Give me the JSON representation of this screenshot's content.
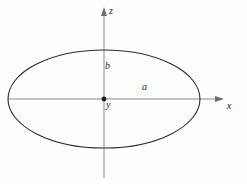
{
  "figure": {
    "kind": "ellipse-coordinate-diagram",
    "background_color": "#fefefe",
    "stroke_color": "#2b2b2b",
    "axis_color": "#8a8a8a",
    "label_color": "#1b1b1b"
  },
  "axes": {
    "vertical": {
      "name": "z-axis",
      "label": "z",
      "arrow_direction": "up",
      "x": 104,
      "y_top": 8,
      "y_bottom": 178
    },
    "horizontal": {
      "name": "x-axis",
      "label": "x",
      "arrow_direction": "right",
      "y": 99,
      "x_left": 8,
      "x_right": 224
    },
    "into_page": {
      "name": "y-axis",
      "label": "y",
      "marker": "origin-dot"
    }
  },
  "origin": {
    "label": "y",
    "cx": 104,
    "cy": 99,
    "dot_radius": 2.4
  },
  "ellipse": {
    "cx": 104,
    "cy": 99,
    "semi_major_a": 96,
    "semi_minor_b": 49,
    "stroke_width": 1.1
  },
  "parameters": [
    {
      "name": "semi-minor-axis",
      "label": "b",
      "axis": "z",
      "position": "above-origin"
    },
    {
      "name": "semi-major-axis",
      "label": "a",
      "axis": "x",
      "position": "right-of-origin"
    }
  ],
  "chart_data": {
    "type": "line",
    "title": "",
    "xlabel": "x",
    "ylabel": "z",
    "grid": false,
    "legend": null,
    "annotations": [
      {
        "text": "z",
        "role": "axis-label",
        "x": 112,
        "y": 11
      },
      {
        "text": "x",
        "role": "axis-label",
        "x": 230,
        "y": 106
      },
      {
        "text": "b",
        "role": "semi-minor-axis-label",
        "x": 108,
        "y": 66
      },
      {
        "text": "y",
        "role": "origin-axis-label",
        "x": 109,
        "y": 105
      },
      {
        "text": "a",
        "role": "semi-major-axis-label",
        "x": 146,
        "y": 87
      }
    ],
    "series": [
      {
        "name": "ellipse",
        "equation": "x^2/a^2 + z^2/b^2 = 1",
        "center": [
          0,
          0
        ],
        "a": 96,
        "b": 49
      }
    ],
    "xlim": [
      -104,
      120
    ],
    "ylim": [
      -79,
      91
    ]
  }
}
